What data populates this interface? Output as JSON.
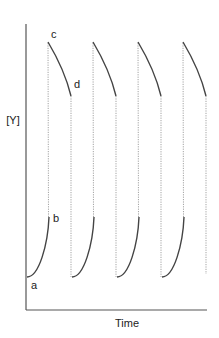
{
  "chart_data": {
    "type": "line",
    "title": "",
    "xlabel": "Time",
    "ylabel": "[Y]",
    "grid": false,
    "legend": null,
    "annotations": [
      {
        "label": "a",
        "meaning": "start of rising segment (low [Y])"
      },
      {
        "label": "b",
        "meaning": "end of rising segment"
      },
      {
        "label": "c",
        "meaning": "start of falling segment (high [Y])"
      },
      {
        "label": "d",
        "meaning": "end of falling segment"
      }
    ],
    "cycles": 4,
    "rising_segments_px": [
      {
        "x0": 27,
        "y0": 277,
        "x1": 49,
        "y1": 217
      },
      {
        "x0": 72,
        "y0": 277,
        "x1": 94,
        "y1": 217
      },
      {
        "x0": 117,
        "y0": 277,
        "x1": 139,
        "y1": 217
      },
      {
        "x0": 162,
        "y0": 277,
        "x1": 184,
        "y1": 217
      }
    ],
    "falling_segments_px": [
      {
        "x0": 48,
        "y0": 42,
        "x1": 71,
        "y1": 96
      },
      {
        "x0": 93,
        "y0": 42,
        "x1": 116,
        "y1": 96
      },
      {
        "x0": 138,
        "y0": 42,
        "x1": 161,
        "y1": 96
      },
      {
        "x0": 183,
        "y0": 42,
        "x1": 206,
        "y1": 96
      }
    ],
    "colors": {
      "curve": "#444444",
      "axis": "#555555",
      "dotted": "#999999",
      "text": "#222222"
    }
  },
  "labels": {
    "y_axis": "[Y]",
    "x_axis": "Time",
    "a": "a",
    "b": "b",
    "c": "c",
    "d": "d"
  }
}
